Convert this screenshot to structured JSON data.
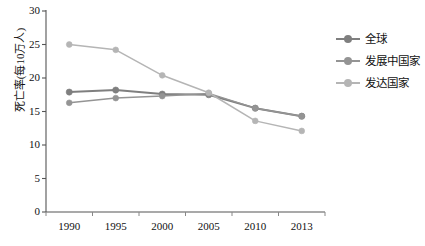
{
  "chart_data": {
    "type": "line",
    "title": "",
    "xlabel": "",
    "ylabel": "死亡率(每10万人)",
    "categories": [
      "1990",
      "1995",
      "2000",
      "2005",
      "2010",
      "2013"
    ],
    "ylim": [
      0,
      30
    ],
    "yticks": [
      0,
      5,
      10,
      15,
      20,
      25,
      30
    ],
    "grid": false,
    "legend_position": "right",
    "series": [
      {
        "name": "全球",
        "color": "#7f7f7f",
        "values": [
          17.9,
          18.2,
          17.6,
          17.5,
          15.5,
          14.3
        ]
      },
      {
        "name": "发展中国家",
        "color": "#949494",
        "values": [
          16.3,
          17.0,
          17.3,
          17.7,
          15.5,
          14.3
        ]
      },
      {
        "name": "发达国家",
        "color": "#b5b5b5",
        "values": [
          25.0,
          24.2,
          20.4,
          17.8,
          13.6,
          12.1
        ]
      }
    ]
  },
  "axes": {
    "y_tick_labels": [
      "30",
      "25",
      "20",
      "15",
      "10",
      "5",
      "0"
    ],
    "x_tick_labels": [
      "1990",
      "1995",
      "2000",
      "2005",
      "2010",
      "2013"
    ]
  },
  "legend": {
    "items": [
      {
        "label": "全球",
        "color": "#7f7f7f"
      },
      {
        "label": "发展中国家",
        "color": "#949494"
      },
      {
        "label": "发达国家",
        "color": "#b5b5b5"
      }
    ]
  }
}
